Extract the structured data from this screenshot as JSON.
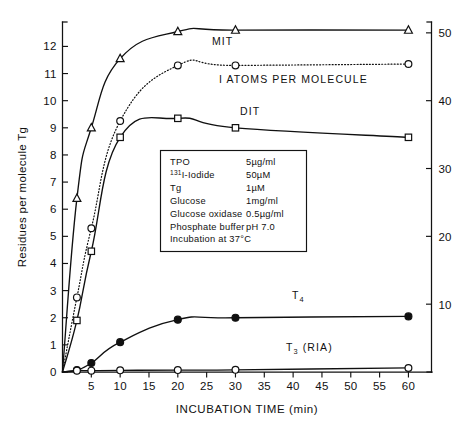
{
  "figure": {
    "background": "#ffffff",
    "ink_color": "#111111"
  },
  "chart_data": {
    "type": "line",
    "title": "",
    "xlabel": "INCUBATION  TIME   (min)",
    "ylabel": "Residues per molecule Tg",
    "ylabel_right": "",
    "xlim": [
      0,
      64
    ],
    "ylim": [
      0,
      12.9
    ],
    "ylim_right": [
      0,
      51.6
    ],
    "grid": false,
    "legend_position": "inline-labels",
    "xticks": [
      5,
      10,
      15,
      20,
      25,
      30,
      35,
      40,
      45,
      50,
      55,
      60
    ],
    "xticklabels": [
      "5",
      "10",
      "15",
      "20",
      "25",
      "30",
      "35",
      "40",
      "45",
      "50",
      "55",
      "60"
    ],
    "yticks": [
      0,
      1,
      2,
      3,
      4,
      5,
      6,
      7,
      8,
      9,
      10,
      11,
      12
    ],
    "yticklabels": [
      "0",
      "1",
      "2",
      "3",
      "4",
      "5",
      "6",
      "7",
      "8",
      "9",
      "10",
      "11",
      "12"
    ],
    "yticks_right": [
      10,
      20,
      30,
      40,
      50
    ],
    "yticklabels_right": [
      "10",
      "20",
      "30",
      "40",
      "50"
    ],
    "series": [
      {
        "name": "MIT",
        "label": "MIT",
        "marker": "triangle-open",
        "linestyle": "solid",
        "axis": "left",
        "x": [
          0,
          2.5,
          5,
          10,
          20,
          30,
          60
        ],
        "values": [
          0,
          6.4,
          9.0,
          11.55,
          12.55,
          12.6,
          12.6
        ]
      },
      {
        "name": "I ATOMS PER MOLECULE",
        "label": "I ATOMS PER MOLECULE",
        "marker": "circle-open",
        "linestyle": "dotted",
        "axis": "left",
        "x": [
          0,
          2.5,
          5,
          10,
          20,
          30,
          60
        ],
        "values": [
          0,
          2.75,
          5.3,
          9.25,
          11.3,
          11.3,
          11.35
        ]
      },
      {
        "name": "DIT",
        "label": "DIT",
        "marker": "square-open",
        "linestyle": "solid",
        "axis": "left",
        "x": [
          0,
          2.5,
          5,
          10,
          20,
          30,
          60
        ],
        "values": [
          0,
          1.9,
          4.45,
          8.65,
          9.35,
          9.0,
          8.65
        ]
      },
      {
        "name": "T4",
        "label": "T4",
        "label_base": "T",
        "label_sub": "4",
        "marker": "circle-filled",
        "linestyle": "solid",
        "axis": "left",
        "x": [
          0,
          2.5,
          5,
          10,
          20,
          30,
          60
        ],
        "values": [
          0,
          0.07,
          0.33,
          1.1,
          1.93,
          2.0,
          2.05
        ]
      },
      {
        "name": "T3 (RIA)",
        "label": "T3 (RIA)",
        "label_base": "T",
        "label_sub": "3",
        "label_tail": " (RIA)",
        "marker": "circle-open",
        "linestyle": "solid",
        "axis": "left",
        "x": [
          0,
          2.5,
          5,
          10,
          20,
          30,
          60
        ],
        "values": [
          0,
          0.05,
          0.05,
          0.06,
          0.07,
          0.08,
          0.15
        ]
      }
    ],
    "annotations": {
      "MIT": {
        "text": "MIT",
        "x": 24,
        "y": 12.1
      },
      "I_ATOMS": {
        "text": "I ATOMS PER MOLECULE",
        "x": 27,
        "y": 10.75
      },
      "DIT": {
        "text": "DIT",
        "x": 25,
        "y": 9.5
      },
      "T4": {
        "text": "T4",
        "x": 27,
        "y": 2.5
      },
      "T3": {
        "text": "T3 (RIA)",
        "x": 27,
        "y": 0.75
      }
    }
  },
  "param_box": {
    "rows": [
      {
        "name": "TPO",
        "value": "5µg/ml",
        "sup": ""
      },
      {
        "name": "I-Iodide",
        "value": "50µM",
        "sup": "131"
      },
      {
        "name": "Tg",
        "value": "1µM",
        "sup": ""
      },
      {
        "name": "Glucose",
        "value": "1mg/ml",
        "sup": ""
      },
      {
        "name": "Glucose oxidase",
        "value": "0.5µg/ml",
        "sup": ""
      },
      {
        "name": "Phosphate buffer",
        "value": "pH 7.0",
        "sup": ""
      },
      {
        "name": "Incubation at 37°C",
        "value": "",
        "sup": ""
      }
    ]
  }
}
